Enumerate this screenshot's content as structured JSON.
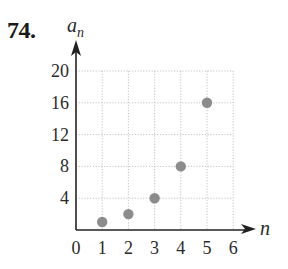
{
  "problem": {
    "number": "74."
  },
  "chart_data": {
    "type": "scatter",
    "title": "",
    "xlabel": "n",
    "ylabel": "a_n",
    "ylabel_main": "a",
    "ylabel_sub": "n",
    "xlim": [
      0,
      6
    ],
    "ylim": [
      0,
      20
    ],
    "x_ticks": [
      "0",
      "1",
      "2",
      "3",
      "4",
      "5",
      "6"
    ],
    "y_ticks": [
      "4",
      "8",
      "12",
      "16",
      "20"
    ],
    "grid": true,
    "grid_style": "dotted",
    "marker_color": "#8c8c8c",
    "points": [
      {
        "x": 1,
        "y": 1
      },
      {
        "x": 2,
        "y": 2
      },
      {
        "x": 3,
        "y": 4
      },
      {
        "x": 4,
        "y": 8
      },
      {
        "x": 5,
        "y": 16
      }
    ]
  }
}
